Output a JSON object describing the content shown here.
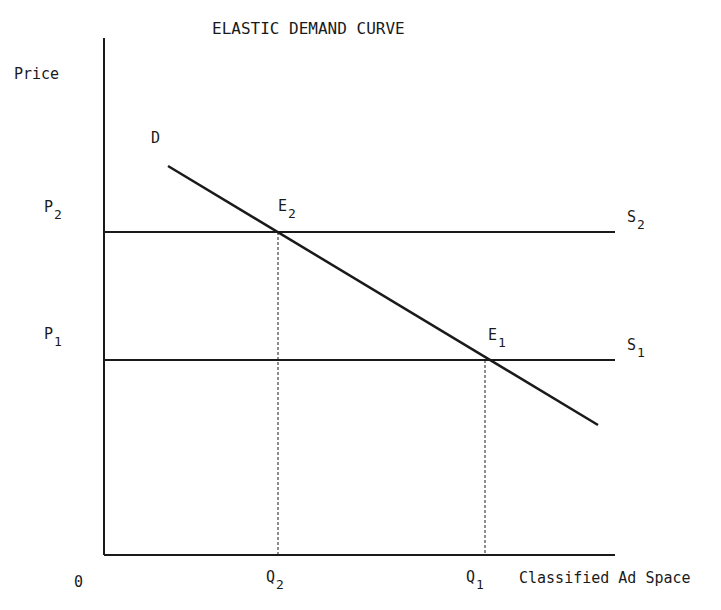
{
  "title": "ELASTIC DEMAND CURVE",
  "axes": {
    "y_label": "Price",
    "x_label": "Classified Ad Space",
    "origin": "0"
  },
  "curves": {
    "demand": "D",
    "supply_high": {
      "base": "S",
      "sub": "2"
    },
    "supply_low": {
      "base": "S",
      "sub": "1"
    }
  },
  "points": {
    "e2": {
      "base": "E",
      "sub": "2"
    },
    "e1": {
      "base": "E",
      "sub": "1"
    }
  },
  "ticks": {
    "p2": {
      "base": "P",
      "sub": "2"
    },
    "p1": {
      "base": "P",
      "sub": "1"
    },
    "q2": {
      "base": "Q",
      "sub": "2"
    },
    "q1": {
      "base": "Q",
      "sub": "1"
    }
  },
  "colors": {
    "ink": "#1a1a1a",
    "background": "#ffffff"
  }
}
